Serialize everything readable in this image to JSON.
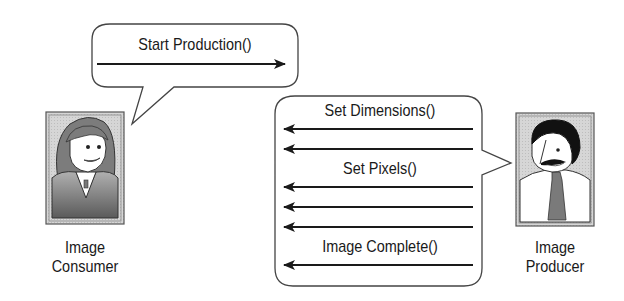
{
  "diagram": {
    "type": "sequence-speech-bubbles",
    "actors": [
      {
        "id": "consumer",
        "label_line1": "Image",
        "label_line2": "Consumer"
      },
      {
        "id": "producer",
        "label_line1": "Image",
        "label_line2": "Producer"
      }
    ],
    "consumer_bubble": {
      "messages": [
        {
          "label": "Start Production()",
          "direction": "right",
          "arrows": 1
        }
      ]
    },
    "producer_bubble": {
      "messages": [
        {
          "label": "Set Dimensions()",
          "direction": "left",
          "arrows": 2
        },
        {
          "label": "Set Pixels()",
          "direction": "left",
          "arrows": 3
        },
        {
          "label": "Image Complete()",
          "direction": "left",
          "arrows": 1
        }
      ]
    }
  },
  "colors": {
    "line": "#1a1a1a",
    "frame_bg": "#d4d4d4",
    "hair_consumer": "#7a7a7a",
    "hair_producer": "#111111",
    "tie": "#7a7a7a"
  }
}
